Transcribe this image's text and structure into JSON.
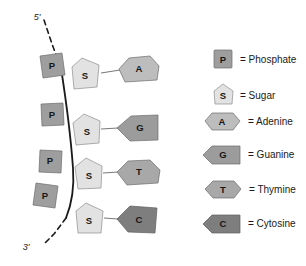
{
  "diagram": {
    "strand": {
      "five_prime_label": "5'",
      "three_prime_label": "3'",
      "backbone_color": "#1a1a1a"
    },
    "colors": {
      "phosphate": "#9e9e9e",
      "sugar": "#e2e2e2",
      "adenine": "#bdbdbd",
      "guanine": "#9c9c9c",
      "thymine": "#a8a8a8",
      "cytosine": "#7e7e7e",
      "outline": "#6b6b6b",
      "connector": "#7a7a7a",
      "text": "#161616"
    },
    "nucleotides": [
      {
        "phosphate_label": "P",
        "sugar_label": "S",
        "base_label": "A",
        "base_name": "Adenine",
        "base_shape": "hexagon"
      },
      {
        "phosphate_label": "P",
        "sugar_label": "S",
        "base_label": "G",
        "base_name": "Guanine",
        "base_shape": "pentagon-left"
      },
      {
        "phosphate_label": "P",
        "sugar_label": "S",
        "base_label": "T",
        "base_name": "Thymine",
        "base_shape": "hexagon"
      },
      {
        "phosphate_label": "P",
        "sugar_label": "S",
        "base_label": "C",
        "base_name": "Cytosine",
        "base_shape": "pentagon-left"
      }
    ]
  },
  "legend": {
    "items": [
      {
        "symbol": "P",
        "equals": "= Phosphate",
        "shape": "square",
        "color": "#9e9e9e"
      },
      {
        "symbol": "S",
        "equals": "= Sugar",
        "shape": "pentagon-up",
        "color": "#e2e2e2"
      },
      {
        "symbol": "A",
        "equals": "= Adenine",
        "shape": "hexagon",
        "color": "#bdbdbd"
      },
      {
        "symbol": "G",
        "equals": "= Guanine",
        "shape": "pentagon-left",
        "color": "#9c9c9c"
      },
      {
        "symbol": "T",
        "equals": "= Thymine",
        "shape": "hexagon",
        "color": "#a8a8a8"
      },
      {
        "symbol": "C",
        "equals": "= Cytosine",
        "shape": "pentagon-left",
        "color": "#7e7e7e"
      }
    ]
  }
}
